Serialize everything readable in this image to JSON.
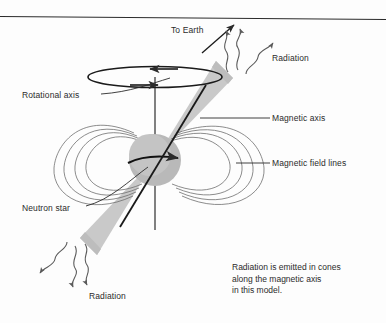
{
  "figure": {
    "type": "pulsar-model-diagram",
    "background_color": "#fdfdfd",
    "ink_color": "#2b2b2b",
    "cone_fill_color": "#c9c9c9",
    "star_fill_color": "#b9b9b9",
    "field_line_color": "#6e6e6e"
  },
  "labels": {
    "to_earth": "To Earth",
    "radiation_top": "Radiation",
    "rotational_axis": "Rotational axis",
    "magnetic_axis": "Magnetic axis",
    "magnetic_field_lines": "Magnetic field lines",
    "neutron_star": "Neutron star",
    "radiation_bottom": "Radiation"
  },
  "caption": {
    "line1": "Radiation is emitted in cones",
    "line2": "along the magnetic axis",
    "line3": "in this model."
  }
}
